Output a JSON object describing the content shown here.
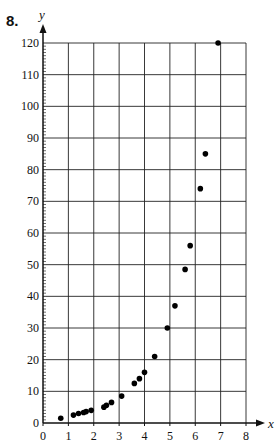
{
  "question_number": "8.",
  "chart_data": {
    "type": "scatter",
    "title": "",
    "xlabel": "x",
    "ylabel": "y",
    "xlim": [
      0,
      8
    ],
    "ylim": [
      0,
      120
    ],
    "grid": true,
    "x_ticks": [
      0,
      1,
      2,
      3,
      4,
      5,
      6,
      7,
      8
    ],
    "y_ticks": [
      0,
      10,
      20,
      30,
      40,
      50,
      60,
      70,
      80,
      90,
      100,
      110,
      120
    ],
    "y_minor_step": 1,
    "points": [
      {
        "x": 0.7,
        "y": 1.5
      },
      {
        "x": 1.2,
        "y": 2.5
      },
      {
        "x": 1.4,
        "y": 3.0
      },
      {
        "x": 1.6,
        "y": 3.3
      },
      {
        "x": 1.7,
        "y": 3.6
      },
      {
        "x": 1.9,
        "y": 4.0
      },
      {
        "x": 2.4,
        "y": 5.0
      },
      {
        "x": 2.5,
        "y": 5.6
      },
      {
        "x": 2.7,
        "y": 6.5
      },
      {
        "x": 3.1,
        "y": 8.5
      },
      {
        "x": 3.6,
        "y": 12.5
      },
      {
        "x": 3.8,
        "y": 14.0
      },
      {
        "x": 4.0,
        "y": 16.0
      },
      {
        "x": 4.4,
        "y": 21.0
      },
      {
        "x": 4.9,
        "y": 30.0
      },
      {
        "x": 5.2,
        "y": 37.0
      },
      {
        "x": 5.6,
        "y": 48.5
      },
      {
        "x": 5.8,
        "y": 56.0
      },
      {
        "x": 6.2,
        "y": 74.0
      },
      {
        "x": 6.4,
        "y": 85.0
      },
      {
        "x": 6.9,
        "y": 120.0
      }
    ],
    "colors": {
      "axis": "#111111",
      "grid": "#222222",
      "point": "#000000"
    }
  }
}
